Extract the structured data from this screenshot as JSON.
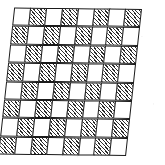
{
  "figure": {
    "type": "checkerboard-grid"
  },
  "board": {
    "rows": 8,
    "columns": 8,
    "cell_size_px": 17,
    "line_color": "#1a1a1a",
    "light_cell_color": "#ffffff",
    "hatch_color": "#2b2b2b",
    "hatch_angle_deg": 45,
    "skew_deg": -6.2,
    "fill_names": {
      "light": "white",
      "dark": "diagonal-hatch"
    },
    "cells": [
      [
        "light",
        "dark",
        "light",
        "dark",
        "light",
        "dark",
        "light",
        "dark"
      ],
      [
        "dark",
        "light",
        "dark",
        "light",
        "dark",
        "light",
        "dark",
        "light"
      ],
      [
        "light",
        "dark",
        "light",
        "dark",
        "light",
        "dark",
        "light",
        "dark"
      ],
      [
        "dark",
        "light",
        "dark",
        "light",
        "dark",
        "light",
        "dark",
        "light"
      ],
      [
        "light",
        "dark",
        "light",
        "dark",
        "light",
        "dark",
        "light",
        "dark"
      ],
      [
        "dark",
        "light",
        "dark",
        "light",
        "dark",
        "light",
        "dark",
        "light"
      ],
      [
        "light",
        "dark",
        "light",
        "dark",
        "light",
        "dark",
        "light",
        "dark"
      ],
      [
        "dark",
        "light",
        "dark",
        "light",
        "dark",
        "light",
        "dark",
        "light"
      ]
    ]
  }
}
